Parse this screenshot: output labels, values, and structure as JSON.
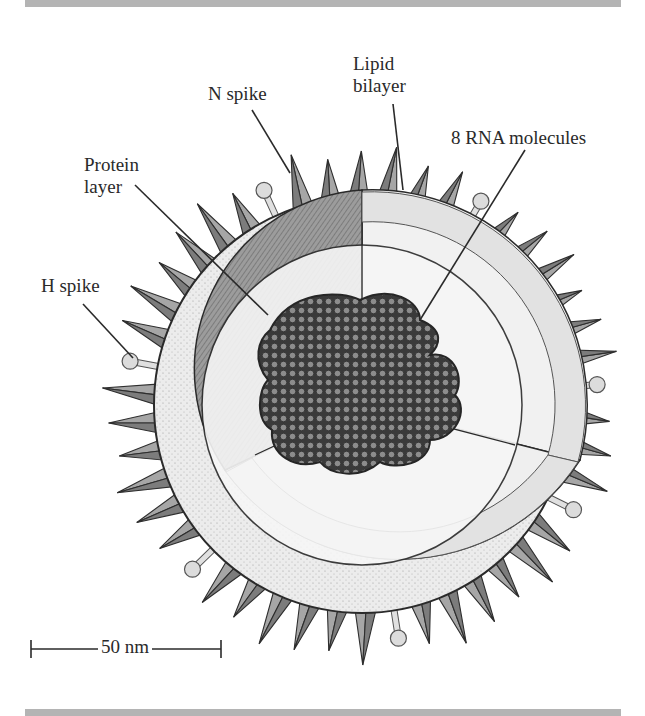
{
  "figure": {
    "labels": {
      "n_spike": "N spike",
      "lipid_bilayer_line1": "Lipid",
      "lipid_bilayer_line2": "bilayer",
      "rna": "8 RNA molecules",
      "protein_layer_line1": "Protein",
      "protein_layer_line2": "layer",
      "h_spike": "H spike"
    },
    "scale_bar": {
      "label": "50 nm"
    },
    "colors": {
      "rule": "#b4b4b4",
      "spike_fill": "#9a9a9a",
      "spike_dark": "#6e6e6e",
      "envelope_fill": "#e6e6e6",
      "protein_layer_fill": "#8e8e8e",
      "core_fill": "#f4f4f4",
      "rna_dark": "#3a3a3a",
      "rna_bead": "#8c8c8c",
      "ink": "#2a2a2a"
    }
  }
}
